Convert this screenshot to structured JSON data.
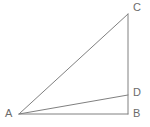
{
  "figure": {
    "background_color": "#ffffff",
    "stroke_color": "#808080",
    "label_color": "#6b6b6b",
    "stroke_width": 1,
    "width": 150,
    "height": 127,
    "points": {
      "A": {
        "label": "A",
        "x": 19,
        "y": 114
      },
      "B": {
        "label": "B",
        "x": 128,
        "y": 114
      },
      "C": {
        "label": "C",
        "x": 128,
        "y": 14
      },
      "D": {
        "label": "D",
        "x": 128,
        "y": 95
      }
    },
    "segments": [
      {
        "name": "AC",
        "from": "A",
        "to": "C",
        "role": "hypotenuse"
      },
      {
        "name": "AB",
        "from": "A",
        "to": "B",
        "role": "base"
      },
      {
        "name": "AD",
        "from": "A",
        "to": "D",
        "role": "cevian"
      },
      {
        "name": "CB",
        "from": "C",
        "to": "B",
        "role": "vertical-leg"
      }
    ]
  }
}
